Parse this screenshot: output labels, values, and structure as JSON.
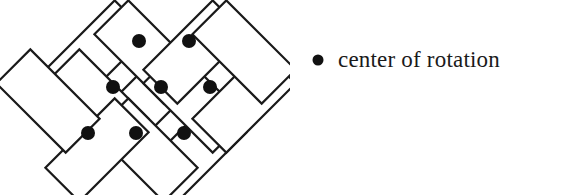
{
  "figure": {
    "name": "herringbone-tiling-with-rotation-centers",
    "background_color": "#ffffff",
    "stroke_color": "#1a1a1a",
    "dot_color": "#111111",
    "stroke_width": 2.2,
    "tiling": {
      "description": "Herringbone / pinwheel tiling of congruent rectangles rotated at plus and minus 45 degrees",
      "rect_length": 98,
      "rect_width": 48,
      "rectangles": [
        {
          "id": "r1",
          "cx": 97,
          "cy": 52,
          "angle": -45
        },
        {
          "id": "r2",
          "cx": 146,
          "cy": 101,
          "angle": -45
        },
        {
          "id": "r3",
          "cx": 195,
          "cy": 150,
          "angle": -45
        },
        {
          "id": "r4",
          "cx": 146,
          "cy": 52,
          "angle": 45
        },
        {
          "id": "r5",
          "cx": 195,
          "cy": 101,
          "angle": 45
        },
        {
          "id": "r6",
          "cx": 97,
          "cy": 101,
          "angle": 45
        },
        {
          "id": "r7",
          "cx": 146,
          "cy": 150,
          "angle": 45
        },
        {
          "id": "r8",
          "cx": 195,
          "cy": 52,
          "angle": -45
        },
        {
          "id": "r9",
          "cx": 244,
          "cy": 101,
          "angle": -45
        },
        {
          "id": "r10",
          "cx": 244,
          "cy": 52,
          "angle": 45
        },
        {
          "id": "r11",
          "cx": 97,
          "cy": 150,
          "angle": -45
        },
        {
          "id": "r12",
          "cx": 48,
          "cy": 101,
          "angle": 45
        }
      ]
    },
    "rotation_centers": {
      "label": "center of rotation",
      "radius": 7,
      "points": [
        {
          "id": "c1",
          "x": 139,
          "y": 41
        },
        {
          "id": "c2",
          "x": 189,
          "y": 41
        },
        {
          "id": "c3",
          "x": 113,
          "y": 87
        },
        {
          "id": "c4",
          "x": 161,
          "y": 87
        },
        {
          "id": "c5",
          "x": 210,
          "y": 87
        },
        {
          "id": "c6",
          "x": 88,
          "y": 133
        },
        {
          "id": "c7",
          "x": 136,
          "y": 133
        },
        {
          "id": "c8",
          "x": 184,
          "y": 133
        }
      ]
    }
  },
  "legend": {
    "bullet_icon": "filled-circle-icon",
    "label": "center of rotation",
    "bullet_radius": 5.5,
    "bullet_color": "#111111",
    "text_color": "#1a1a1a"
  }
}
